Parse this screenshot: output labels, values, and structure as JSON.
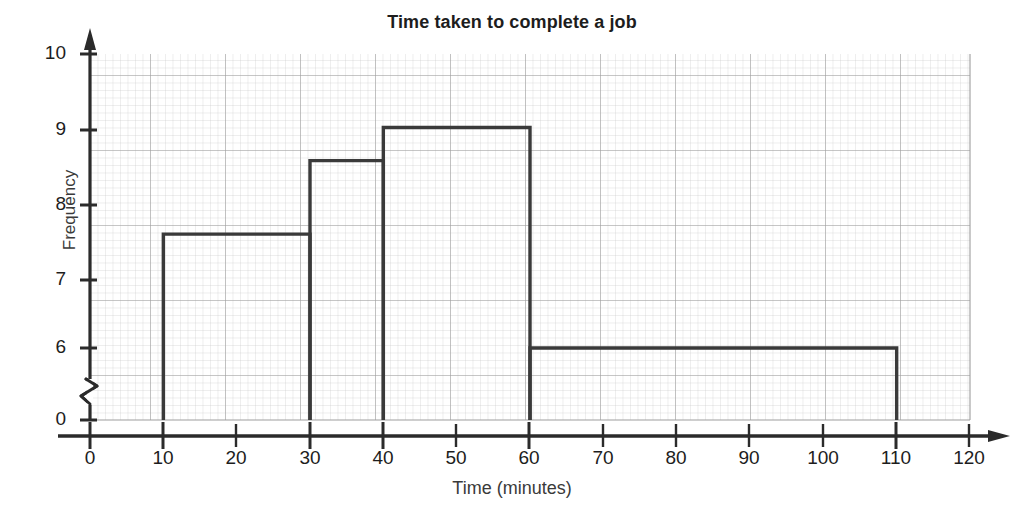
{
  "page": {
    "cropped_header_text": "",
    "background": "#ffffff"
  },
  "chart_data": {
    "type": "bar",
    "title": "Time taken to complete a job",
    "subtitle": "",
    "xlabel": "Time (minutes)",
    "ylabel": "Frequency",
    "xlim": [
      0,
      120
    ],
    "ylim": [
      0,
      10
    ],
    "y_axis_break": true,
    "y_break_between": [
      0,
      6
    ],
    "xticks": [
      "0",
      "10",
      "20",
      "30",
      "40",
      "50",
      "60",
      "70",
      "80",
      "90",
      "100",
      "110",
      "120"
    ],
    "xtick_values": [
      0,
      10,
      20,
      30,
      40,
      50,
      60,
      70,
      80,
      90,
      100,
      110,
      120
    ],
    "yticks": [
      "0",
      "6",
      "7",
      "8",
      "9",
      "10"
    ],
    "ytick_values": [
      0,
      6,
      7,
      8,
      9,
      10
    ],
    "grid": true,
    "grid_minor": true,
    "legend": "none",
    "bar_style": "outline",
    "bar_color": "#ffffff",
    "bar_edge_color": "#3a3a3a",
    "axis_color": "#2b2b2b",
    "grid_major_color": "#9a9a9a",
    "grid_minor_color": "#c9c9c9",
    "bins": [
      {
        "label": "10-30",
        "x_start": 10,
        "x_end": 30,
        "height": 7.55,
        "width": 20
      },
      {
        "label": "30-40",
        "x_start": 30,
        "x_end": 40,
        "height": 8.55,
        "width": 10
      },
      {
        "label": "40-60",
        "x_start": 40,
        "x_end": 60,
        "height": 9.0,
        "width": 20
      },
      {
        "label": "60-110",
        "x_start": 60,
        "x_end": 110,
        "height": 6.0,
        "width": 50
      }
    ],
    "categories": [
      "10-30",
      "30-40",
      "40-60",
      "60-110"
    ],
    "values": [
      7.55,
      8.55,
      9.0,
      6.0
    ]
  }
}
